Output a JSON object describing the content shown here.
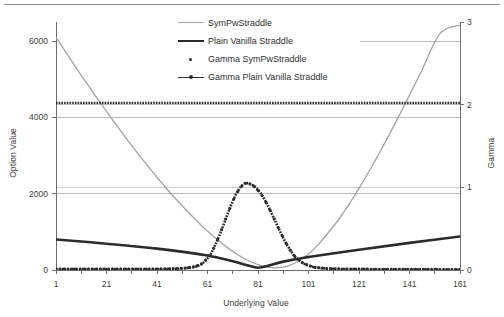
{
  "figure": {
    "top_rule": true,
    "background": "#ffffff"
  },
  "chart_data": {
    "type": "line",
    "title": "",
    "xlabel": "Underlying Value",
    "ylabel": "Option Value",
    "y2label": "Gamma",
    "xlim": [
      1,
      161
    ],
    "ylim": [
      0,
      6500
    ],
    "y2lim": [
      0,
      3
    ],
    "xticks": [
      1,
      21,
      41,
      61,
      81,
      101,
      121,
      141,
      161
    ],
    "yticks": [
      0,
      2000,
      4000,
      6000
    ],
    "y2ticks": [
      0,
      1,
      2,
      3
    ],
    "grid": "horizontal",
    "legend_position": "top-center",
    "colors": {
      "sympw_straddle": "#a3a3a3",
      "plain_vanilla_straddle": "#2b2b2b",
      "gamma_sympw_straddle": "#2b2b2b",
      "gamma_plain_vanilla_straddle": "#2b2b2b",
      "gridline": "#9a9a9a",
      "axis": "#6e6e6e",
      "text": "#3c3c3c"
    },
    "series": [
      {
        "name": "SymPwStraddle",
        "axis": "left",
        "style": "solid-thin",
        "color": "#a3a3a3",
        "x": [
          1,
          9,
          17,
          25,
          33,
          41,
          49,
          57,
          61,
          65,
          69,
          73,
          77,
          81,
          85,
          89,
          93,
          97,
          101,
          105,
          113,
          121,
          129,
          137,
          145,
          153,
          161
        ],
        "values": [
          6100,
          5300,
          4530,
          3790,
          3090,
          2430,
          1820,
          1270,
          1020,
          790,
          580,
          400,
          250,
          140,
          75,
          60,
          110,
          230,
          420,
          680,
          1330,
          2140,
          3060,
          4060,
          5110,
          6190,
          6420
        ]
      },
      {
        "name": "Plain Vanilla Straddle",
        "axis": "left",
        "style": "solid-thick",
        "color": "#2b2b2b",
        "x": [
          1,
          21,
          41,
          61,
          71,
          76,
          81,
          86,
          91,
          101,
          121,
          141,
          161
        ],
        "values": [
          800,
          690,
          560,
          380,
          230,
          140,
          60,
          130,
          220,
          340,
          530,
          710,
          880
        ]
      },
      {
        "name": "Gamma SymPwStraddle",
        "axis": "right",
        "style": "dotted",
        "color": "#2b2b2b",
        "x": [
          1,
          161
        ],
        "values": [
          2.02,
          2.02
        ]
      },
      {
        "name": "Gamma Plain Vanilla Straddle",
        "axis": "right",
        "style": "dotted-markers",
        "color": "#2b2b2b",
        "x": [
          1,
          41,
          51,
          56,
          59,
          62,
          64,
          66,
          68,
          70,
          72,
          74,
          76,
          78,
          80,
          82,
          84,
          86,
          88,
          90,
          92,
          94,
          96,
          99,
          103,
          108,
          115,
          125,
          141,
          161
        ],
        "values": [
          0.01,
          0.012,
          0.02,
          0.04,
          0.08,
          0.18,
          0.3,
          0.44,
          0.6,
          0.76,
          0.9,
          1.0,
          1.05,
          1.04,
          1.0,
          0.93,
          0.83,
          0.71,
          0.58,
          0.45,
          0.33,
          0.23,
          0.15,
          0.08,
          0.035,
          0.018,
          0.012,
          0.01,
          0.008,
          0.006
        ]
      }
    ]
  },
  "legend": {
    "items": [
      {
        "label": "SymPwStraddle",
        "key": "line-gray"
      },
      {
        "label": "Plain Vanilla Straddle",
        "key": "line-black"
      },
      {
        "label": "Gamma SymPwStraddle",
        "key": "dot"
      },
      {
        "label": "Gamma Plain Vanilla Straddle",
        "key": "dash-dot"
      }
    ]
  },
  "axes": {
    "left_title": "Option Value",
    "right_title": "Gamma",
    "bottom_title": "Underlying Value",
    "left_ticks": [
      "0",
      "2000",
      "4000",
      "6000"
    ],
    "right_ticks": [
      "0",
      "1",
      "2",
      "3"
    ],
    "bottom_ticks": [
      "1",
      "21",
      "41",
      "61",
      "81",
      "101",
      "121",
      "141",
      "161"
    ]
  }
}
